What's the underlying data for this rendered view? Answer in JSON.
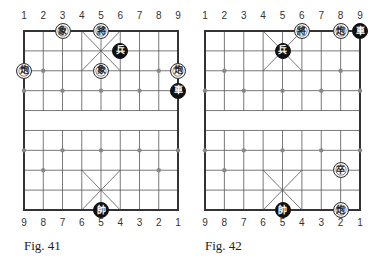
{
  "figures": [
    {
      "caption": "Fig. 41",
      "top_files": [
        "1",
        "2",
        "3",
        "4",
        "5",
        "6",
        "7",
        "8",
        "9"
      ],
      "bottom_files": [
        "9",
        "8",
        "7",
        "6",
        "5",
        "4",
        "3",
        "2",
        "1"
      ],
      "pieces": [
        {
          "char": "象",
          "color": "white",
          "col": 2,
          "row": 0
        },
        {
          "char": "將",
          "color": "white",
          "col": 4,
          "row": 0
        },
        {
          "char": "兵",
          "color": "black",
          "col": 5,
          "row": 1
        },
        {
          "char": "象",
          "color": "white",
          "col": 4,
          "row": 2
        },
        {
          "char": "炮",
          "color": "white",
          "col": 0,
          "row": 2
        },
        {
          "char": "炮",
          "color": "white",
          "col": 8,
          "row": 2
        },
        {
          "char": "車",
          "color": "black",
          "col": 8,
          "row": 3
        },
        {
          "char": "帥",
          "color": "black",
          "col": 4,
          "row": 9
        }
      ]
    },
    {
      "caption": "Fig. 42",
      "top_files": [
        "1",
        "2",
        "3",
        "4",
        "5",
        "6",
        "7",
        "8",
        "9"
      ],
      "bottom_files": [
        "9",
        "8",
        "7",
        "6",
        "5",
        "4",
        "3",
        "2",
        "1"
      ],
      "pieces": [
        {
          "char": "將",
          "color": "white",
          "col": 5,
          "row": 0
        },
        {
          "char": "炮",
          "color": "white",
          "col": 7,
          "row": 0
        },
        {
          "char": "車",
          "color": "black",
          "col": 8,
          "row": 0
        },
        {
          "char": "兵",
          "color": "black",
          "col": 4,
          "row": 1
        },
        {
          "char": "卒",
          "color": "white",
          "col": 7,
          "row": 7
        },
        {
          "char": "炮",
          "color": "white",
          "col": 7,
          "row": 9
        },
        {
          "char": "帥",
          "color": "black",
          "col": 4,
          "row": 9
        }
      ]
    }
  ],
  "colors": {
    "line": "#555555",
    "border": "#333333",
    "black_piece": "#111111",
    "white_piece": "#ffffff"
  }
}
